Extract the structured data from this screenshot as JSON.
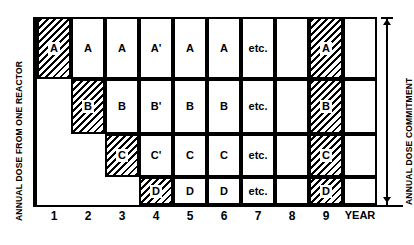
{
  "axes": {
    "y_left_label": "ANNUAL DOSE FROM ONE REACTOR",
    "y_right_label": "ANNUAL DOSE COMMITMENT",
    "x_unit_label": "YEAR"
  },
  "x_ticks": [
    "1",
    "2",
    "3",
    "4",
    "5",
    "6",
    "7",
    "8",
    "9"
  ],
  "chart_data": {
    "type": "bar",
    "title": "",
    "subtitle": "",
    "xlabel": "YEAR",
    "ylabel": "ANNUAL DOSE FROM ONE REACTOR",
    "y_right_label": "ANNUAL DOSE COMMITMENT",
    "grid": false,
    "legend": "none",
    "categories": [
      "1",
      "2",
      "3",
      "4",
      "5",
      "6",
      "7",
      "8",
      "9"
    ],
    "row_bands": [
      {
        "name": "A",
        "top": 0,
        "height": 62
      },
      {
        "name": "B",
        "top": 62,
        "height": 55
      },
      {
        "name": "C",
        "top": 117,
        "height": 43
      },
      {
        "name": "D",
        "top": 160,
        "height": 28
      }
    ],
    "series": [
      {
        "name": "A",
        "values": [
          0,
          1,
          1,
          1,
          1,
          1,
          1,
          0,
          1
        ]
      },
      {
        "name": "B",
        "values": [
          0,
          0,
          1,
          1,
          1,
          1,
          1,
          0,
          1
        ]
      },
      {
        "name": "C",
        "values": [
          0,
          0,
          0,
          1,
          1,
          1,
          1,
          0,
          1
        ]
      },
      {
        "name": "D",
        "values": [
          1,
          1,
          1,
          1,
          1,
          1,
          1,
          0,
          1
        ]
      }
    ],
    "columns": [
      {
        "year": "1",
        "cells": [
          {
            "row": "A",
            "label": "A",
            "hatched": true,
            "visible": true
          }
        ]
      },
      {
        "year": "2",
        "cells": [
          {
            "row": "A",
            "label": "A",
            "hatched": false,
            "visible": true
          },
          {
            "row": "B",
            "label": "B",
            "hatched": true,
            "visible": true
          }
        ]
      },
      {
        "year": "3",
        "cells": [
          {
            "row": "A",
            "label": "A",
            "hatched": false,
            "visible": true
          },
          {
            "row": "B",
            "label": "B",
            "hatched": false,
            "visible": true
          },
          {
            "row": "C",
            "label": "C",
            "hatched": true,
            "visible": true
          }
        ]
      },
      {
        "year": "4",
        "cells": [
          {
            "row": "A",
            "label": "A'",
            "hatched": false,
            "visible": true
          },
          {
            "row": "B",
            "label": "B'",
            "hatched": false,
            "visible": true
          },
          {
            "row": "C",
            "label": "C'",
            "hatched": false,
            "visible": true
          },
          {
            "row": "D",
            "label": "D",
            "hatched": true,
            "visible": true
          }
        ]
      },
      {
        "year": "5",
        "cells": [
          {
            "row": "A",
            "label": "A",
            "hatched": false,
            "visible": true
          },
          {
            "row": "B",
            "label": "B",
            "hatched": false,
            "visible": true
          },
          {
            "row": "C",
            "label": "C",
            "hatched": false,
            "visible": true
          },
          {
            "row": "D",
            "label": "D",
            "hatched": false,
            "visible": true
          }
        ]
      },
      {
        "year": "6",
        "cells": [
          {
            "row": "A",
            "label": "A",
            "hatched": false,
            "visible": true
          },
          {
            "row": "B",
            "label": "B",
            "hatched": false,
            "visible": true
          },
          {
            "row": "C",
            "label": "C",
            "hatched": false,
            "visible": true
          },
          {
            "row": "D",
            "label": "D",
            "hatched": false,
            "visible": true
          }
        ]
      },
      {
        "year": "7",
        "cells": [
          {
            "row": "A",
            "label": "etc.",
            "hatched": false,
            "visible": true
          },
          {
            "row": "B",
            "label": "etc.",
            "hatched": false,
            "visible": true
          },
          {
            "row": "C",
            "label": "etc.",
            "hatched": false,
            "visible": true
          },
          {
            "row": "D",
            "label": "etc.",
            "hatched": false,
            "visible": true
          }
        ]
      },
      {
        "year": "8",
        "cells": [
          {
            "row": "A",
            "label": "",
            "hatched": false,
            "visible": true
          },
          {
            "row": "B",
            "label": "",
            "hatched": false,
            "visible": true
          },
          {
            "row": "C",
            "label": "",
            "hatched": false,
            "visible": true
          },
          {
            "row": "D",
            "label": "",
            "hatched": false,
            "visible": true
          }
        ]
      },
      {
        "year": "9",
        "cells": [
          {
            "row": "A",
            "label": "A",
            "hatched": true,
            "visible": true
          },
          {
            "row": "B",
            "label": "B",
            "hatched": true,
            "visible": true
          },
          {
            "row": "C",
            "label": "C",
            "hatched": true,
            "visible": true
          },
          {
            "row": "D",
            "label": "D",
            "hatched": true,
            "visible": true
          }
        ]
      },
      {
        "year": "",
        "cells": [
          {
            "row": "A",
            "label": "",
            "hatched": false,
            "visible": true
          },
          {
            "row": "B",
            "label": "",
            "hatched": false,
            "visible": true
          },
          {
            "row": "C",
            "label": "",
            "hatched": false,
            "visible": true
          },
          {
            "row": "D",
            "label": "",
            "hatched": false,
            "visible": true
          }
        ]
      }
    ]
  }
}
